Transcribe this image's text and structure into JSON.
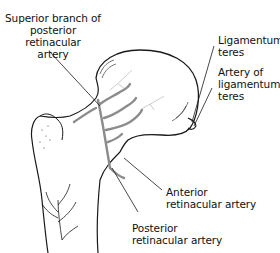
{
  "figure": {
    "colors": {
      "outline": "#1a1a1a",
      "artery": "#8c8c8c",
      "background": "#ffffff"
    },
    "labels": {
      "superior_branch": {
        "lines": [
          "Superior branch of",
          "posterior retinacular",
          "artery"
        ]
      },
      "ligamentum_teres": {
        "lines": [
          "Ligamentum",
          "teres"
        ]
      },
      "artery_of_ligamentum_teres": {
        "lines": [
          "Artery of",
          "ligamentum",
          "teres"
        ]
      },
      "anterior_retinacular": {
        "lines": [
          "Anterior",
          "retinacular artery"
        ]
      },
      "posterior_retinacular": {
        "lines": [
          "Posterior",
          "retinacular artery"
        ]
      }
    }
  }
}
